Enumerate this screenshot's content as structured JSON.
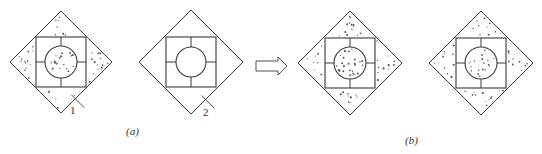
{
  "figure": {
    "stroke_color": "#3a3a3a",
    "fill_dot_color": "#555555",
    "panels": [
      {
        "id": "a1",
        "cx": 61,
        "cy": 62,
        "half": 51,
        "square_half": 25,
        "circle_r": 16,
        "filled_outer": true,
        "filled_circle": true,
        "callout": "1"
      },
      {
        "id": "a2",
        "cx": 191,
        "cy": 62,
        "half": 52,
        "square_half": 25,
        "circle_r": 15,
        "filled_outer": false,
        "filled_circle": false,
        "callout": "2"
      },
      {
        "id": "b1",
        "cx": 350,
        "cy": 63,
        "half": 52,
        "square_half": 25,
        "circle_r": 16,
        "filled_outer": true,
        "filled_circle": true
      },
      {
        "id": "b2",
        "cx": 481,
        "cy": 63,
        "half": 52,
        "square_half": 25,
        "circle_r": 16,
        "filled_outer": true,
        "filled_circle": true
      }
    ],
    "labels": {
      "callout_1": "1",
      "callout_2": "2",
      "caption_a": "(a)",
      "caption_b": "(b)"
    },
    "arrow": {
      "direction": "right",
      "icon": "hollow-right-arrow"
    }
  }
}
